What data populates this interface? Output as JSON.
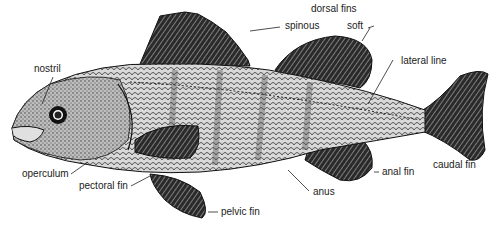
{
  "diagram": {
    "labels": {
      "dorsal_fins": "dorsal fins",
      "spinous": "spinous",
      "soft": "soft",
      "nostril": "nostril",
      "lateral_line": "lateral line",
      "operculum": "operculum",
      "pectoral_fin": "pectoral fin",
      "pelvic_fin": "pelvic fin",
      "anus": "anus",
      "anal_fin": "anal fin",
      "caudal_fin": "caudal fin"
    }
  }
}
